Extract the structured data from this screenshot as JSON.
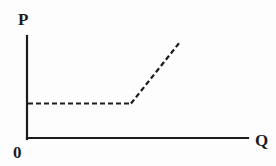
{
  "figure": {
    "name": "kinked-supply-curve-diagram",
    "background_color": "#fdfdfd",
    "line_color": "#1c1c1c",
    "width": 276,
    "height": 166
  },
  "axes": {
    "y_axis": {
      "label": "P",
      "name": "price-axis",
      "x": 27,
      "y_top": 36,
      "y_bottom": 139,
      "stroke_width": 2
    },
    "x_axis": {
      "label": "Q",
      "name": "quantity-axis",
      "y": 138,
      "x_left": 27,
      "x_right": 248,
      "stroke_width": 2
    },
    "origin": {
      "label": "0",
      "name": "origin-label"
    }
  },
  "curve": {
    "name": "supply-curve",
    "style": "dashed",
    "dash_pattern": "5,3",
    "stroke_width": 2.2,
    "description": "Perfectly elastic then upward sloping supply curve",
    "segments": [
      {
        "name": "horizontal-segment",
        "type": "flat",
        "x1": 28,
        "y1": 103,
        "x2": 131,
        "y2": 103
      },
      {
        "name": "rising-segment",
        "type": "upward-sloping",
        "x1": 131,
        "y1": 103,
        "x2": 180,
        "y2": 42
      }
    ],
    "kink_point": {
      "x": 131,
      "y": 103
    }
  },
  "chart_data": {
    "type": "line",
    "title": "",
    "xlabel": "Q",
    "ylabel": "P",
    "grid": false,
    "legend": null,
    "xlim": [
      0,
      10
    ],
    "ylim": [
      0,
      10
    ],
    "series": [
      {
        "name": "Supply",
        "style": "dashed",
        "x": [
          0.05,
          4.7,
          7.0
        ],
        "y": [
          3.4,
          3.4,
          9.4
        ]
      }
    ],
    "annotations": [
      {
        "text": "P",
        "role": "y-axis-label"
      },
      {
        "text": "Q",
        "role": "x-axis-label"
      },
      {
        "text": "0",
        "role": "origin-label"
      }
    ]
  }
}
